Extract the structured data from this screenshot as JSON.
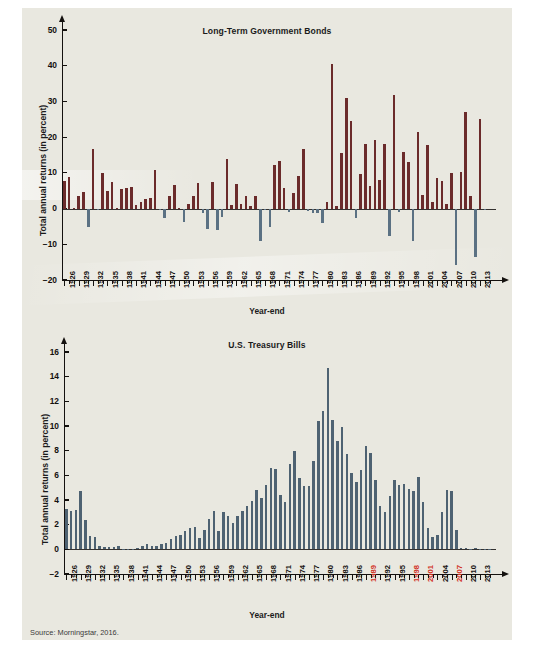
{
  "source_note": "Source: Morningstar, 2016.",
  "colors": {
    "panel_bg": "#e9e8e0",
    "positive_bar": "#6b2b2b",
    "negative_bar": "#5b7183",
    "tbill_bar": "#4e6272",
    "axis": "#14110f",
    "text": "#1b1b1b",
    "label_highlight": "#d1301f"
  },
  "charts": [
    {
      "id": "long-term-government-bonds",
      "title": "Long-Term Government Bonds",
      "ylabel": "Total annual returns (in percent)",
      "xlabel": "Year-end"
    },
    {
      "id": "us-treasury-bills",
      "title": "U.S. Treasury Bills",
      "ylabel": "Total annual returns (in percent)",
      "xlabel": "Year-end"
    }
  ],
  "chart_data": [
    {
      "type": "bar",
      "title": "Long-Term Government Bonds",
      "xlabel": "Year-end",
      "ylabel": "Total annual returns (in percent)",
      "ylim": [
        -20,
        50
      ],
      "yticks": [
        -20,
        -10,
        0,
        10,
        20,
        30,
        40,
        50
      ],
      "ytick_labels": [
        "−20",
        "−10",
        "0",
        "10",
        "20",
        "30",
        "40",
        "50"
      ],
      "grid": false,
      "legend": "none",
      "x_tick_labels": [
        "1926",
        "1929",
        "1932",
        "1935",
        "1938",
        "1941",
        "1944",
        "1947",
        "1950",
        "1953",
        "1956",
        "1959",
        "1962",
        "1965",
        "1968",
        "1971",
        "1974",
        "1977",
        "1980",
        "1983",
        "1986",
        "1989",
        "1992",
        "1995",
        "1998",
        "2001",
        "2004",
        "2007",
        "2010",
        "2013"
      ],
      "x_tick_label_step": 3,
      "categories": [
        1926,
        1927,
        1928,
        1929,
        1930,
        1931,
        1932,
        1933,
        1934,
        1935,
        1936,
        1937,
        1938,
        1939,
        1940,
        1941,
        1942,
        1943,
        1944,
        1945,
        1946,
        1947,
        1948,
        1949,
        1950,
        1951,
        1952,
        1953,
        1954,
        1955,
        1956,
        1957,
        1958,
        1959,
        1960,
        1961,
        1962,
        1963,
        1964,
        1965,
        1966,
        1967,
        1968,
        1969,
        1970,
        1971,
        1972,
        1973,
        1974,
        1975,
        1976,
        1977,
        1978,
        1979,
        1980,
        1981,
        1982,
        1983,
        1984,
        1985,
        1986,
        1987,
        1988,
        1989,
        1990,
        1991,
        1992,
        1993,
        1994,
        1995,
        1996,
        1997,
        1998,
        1999,
        2000,
        2001,
        2002,
        2003,
        2004,
        2005,
        2006,
        2007,
        2008,
        2009,
        2010,
        2011,
        2012,
        2013,
        2014,
        2015
      ],
      "values": [
        7.8,
        8.9,
        0.1,
        3.4,
        4.7,
        -5.3,
        16.8,
        -0.1,
        10.0,
        5.0,
        7.5,
        0.2,
        5.5,
        5.9,
        6.1,
        0.9,
        1.9,
        2.8,
        2.9,
        10.7,
        -0.1,
        -2.6,
        3.4,
        6.5,
        0.1,
        -3.9,
        1.2,
        3.6,
        7.2,
        -1.2,
        -5.6,
        7.5,
        -6.1,
        -2.3,
        13.8,
        0.9,
        6.9,
        1.2,
        3.5,
        0.7,
        3.6,
        -9.2,
        -0.3,
        -5.1,
        12.1,
        13.2,
        5.7,
        -1.1,
        4.3,
        9.2,
        16.8,
        -0.7,
        -1.2,
        -1.2,
        -4.0,
        1.9,
        40.4,
        0.7,
        15.5,
        31.0,
        24.5,
        -2.7,
        9.7,
        18.1,
        6.2,
        19.3,
        8.1,
        18.2,
        -7.8,
        31.7,
        -0.9,
        15.8,
        13.1,
        -9.0,
        21.5,
        3.8,
        17.8,
        1.9,
        8.5,
        7.8,
        1.4,
        9.9,
        -15.9,
        10.2,
        27.1,
        3.4,
        -13.7,
        25.1,
        -0.2
      ],
      "positive_color": "#6b2b2b",
      "negative_color": "#5b7183"
    },
    {
      "type": "bar",
      "title": "U.S. Treasury Bills",
      "xlabel": "Year-end",
      "ylabel": "Total annual returns (in percent)",
      "ylim": [
        -2,
        16
      ],
      "yticks": [
        -2,
        0,
        2,
        4,
        6,
        8,
        10,
        12,
        14,
        16
      ],
      "ytick_labels": [
        "−2",
        "0",
        "2",
        "4",
        "6",
        "8",
        "10",
        "12",
        "14",
        "16"
      ],
      "grid": false,
      "legend": "none",
      "x_tick_labels": [
        "1926",
        "1929",
        "1932",
        "1935",
        "1938",
        "1941",
        "1944",
        "1947",
        "1950",
        "1953",
        "1956",
        "1959",
        "1962",
        "1965",
        "1968",
        "1971",
        "1974",
        "1977",
        "1980",
        "1983",
        "1986",
        "1989",
        "1992",
        "1995",
        "1998",
        "2001",
        "2004",
        "2007",
        "2010",
        "2013"
      ],
      "x_tick_label_step": 3,
      "highlighted_x_labels": [
        "1989",
        "1998",
        "2001",
        "2007"
      ],
      "categories": [
        1926,
        1927,
        1928,
        1929,
        1930,
        1931,
        1932,
        1933,
        1934,
        1935,
        1936,
        1937,
        1938,
        1939,
        1940,
        1941,
        1942,
        1943,
        1944,
        1945,
        1946,
        1947,
        1948,
        1949,
        1950,
        1951,
        1952,
        1953,
        1954,
        1955,
        1956,
        1957,
        1958,
        1959,
        1960,
        1961,
        1962,
        1963,
        1964,
        1965,
        1966,
        1967,
        1968,
        1969,
        1970,
        1971,
        1972,
        1973,
        1974,
        1975,
        1976,
        1977,
        1978,
        1979,
        1980,
        1981,
        1982,
        1983,
        1984,
        1985,
        1986,
        1987,
        1988,
        1989,
        1990,
        1991,
        1992,
        1993,
        1994,
        1995,
        1996,
        1997,
        1998,
        1999,
        2000,
        2001,
        2002,
        2003,
        2004,
        2005,
        2006,
        2007,
        2008,
        2009,
        2010,
        2011,
        2012,
        2013,
        2014,
        2015
      ],
      "values": [
        3.3,
        3.1,
        3.2,
        4.7,
        2.4,
        1.1,
        1.0,
        0.3,
        0.2,
        0.2,
        0.2,
        0.3,
        0.0,
        0.0,
        0.0,
        0.1,
        0.3,
        0.4,
        0.3,
        0.3,
        0.4,
        0.5,
        0.8,
        1.1,
        1.2,
        1.5,
        1.7,
        1.8,
        0.9,
        1.6,
        2.5,
        3.1,
        1.5,
        3.0,
        2.7,
        2.1,
        2.7,
        3.1,
        3.5,
        3.9,
        4.8,
        4.2,
        5.2,
        6.6,
        6.5,
        4.4,
        3.8,
        6.9,
        8.0,
        5.8,
        5.1,
        5.1,
        7.2,
        10.4,
        11.2,
        14.7,
        10.5,
        8.8,
        9.9,
        7.7,
        6.2,
        5.5,
        6.4,
        8.4,
        7.8,
        5.6,
        3.5,
        3.0,
        4.3,
        5.6,
        5.2,
        5.3,
        4.9,
        4.7,
        5.9,
        3.8,
        1.7,
        1.0,
        1.2,
        3.0,
        4.8,
        4.7,
        1.6,
        0.1,
        0.1,
        0.0,
        0.1,
        0.0,
        0.0,
        0.0
      ],
      "bar_color": "#4e6272"
    }
  ]
}
